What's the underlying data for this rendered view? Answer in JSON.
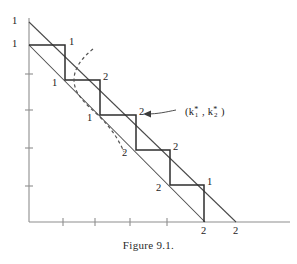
{
  "figure": {
    "caption": "Figure 9.1.",
    "annotation": {
      "open_paren": "(k",
      "sub1": "1",
      "star1": "*",
      "comma": ", k",
      "sub2": "2",
      "star2": "*",
      "close_paren": ")",
      "full_text": "(k1*, k2*)"
    },
    "axis": {
      "origin_x": 29,
      "origin_y": 222,
      "x_axis_end": 290,
      "y_axis_top": 18,
      "x_ticks": [
        63,
        95,
        130,
        167
      ],
      "y_ticks": [
        74,
        110,
        148,
        186
      ]
    },
    "lines": [
      {
        "name": "upper-constraint-line",
        "x1": 29,
        "y1": 22,
        "x2": 236,
        "y2": 222,
        "y_intercept_label": "1",
        "x_intercept_label": "2"
      },
      {
        "name": "lower-constraint-line",
        "x1": 29,
        "y1": 45,
        "x2": 205,
        "y2": 222,
        "y_intercept_label": "1",
        "x_intercept_label": "2"
      }
    ],
    "staircase": {
      "points": [
        [
          29,
          45
        ],
        [
          65,
          45
        ],
        [
          65,
          80
        ],
        [
          100,
          80
        ],
        [
          100,
          115
        ],
        [
          136,
          115
        ],
        [
          136,
          150
        ],
        [
          170,
          150
        ],
        [
          170,
          185
        ],
        [
          204,
          185
        ],
        [
          204,
          222
        ]
      ]
    },
    "dashed_curve": "M 93,49 C 82,58 74,68 74,80 C 74,94 86,104 99,116 C 110,127 118,138 124,152",
    "point_labels": [
      {
        "name": "y-intercept-upper-label",
        "text": "1",
        "x": 12,
        "y": 16
      },
      {
        "name": "y-intercept-lower-label",
        "text": "1",
        "x": 12,
        "y": 39
      },
      {
        "name": "step-label-1",
        "text": "1",
        "x": 69,
        "y": 37
      },
      {
        "name": "step-label-2",
        "text": "1",
        "x": 52,
        "y": 78
      },
      {
        "name": "step-label-3",
        "text": "2",
        "x": 103,
        "y": 72
      },
      {
        "name": "step-label-4",
        "text": "1",
        "x": 87,
        "y": 113
      },
      {
        "name": "step-label-5",
        "text": "2",
        "x": 139,
        "y": 107
      },
      {
        "name": "step-label-6",
        "text": "2",
        "x": 122,
        "y": 148
      },
      {
        "name": "step-label-7",
        "text": "2",
        "x": 173,
        "y": 142
      },
      {
        "name": "step-label-8",
        "text": "2",
        "x": 156,
        "y": 183
      },
      {
        "name": "step-label-9",
        "text": "1",
        "x": 207,
        "y": 177
      },
      {
        "name": "x-intercept-lower-label",
        "text": "2",
        "x": 201,
        "y": 226
      },
      {
        "name": "x-intercept-upper-label",
        "text": "2",
        "x": 233,
        "y": 226
      }
    ],
    "callout": {
      "label_x": 185,
      "label_y": 107,
      "line_path": "M 146,114 C 158,114 166,112 176,110",
      "arrow_points": "143,114 151,110.5 151,117.5"
    }
  }
}
